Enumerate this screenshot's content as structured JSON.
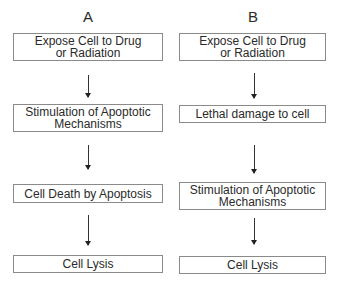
{
  "diagram": {
    "type": "flowchart",
    "columns": [
      {
        "label": "A",
        "steps": [
          "Expose Cell to Drug or Radiation",
          "Stimulation of Apoptotic Mechanisms",
          "Cell Death by Apoptosis",
          "Cell Lysis"
        ]
      },
      {
        "label": "B",
        "steps": [
          "Expose Cell to Drug or Radiation",
          "Lethal damage to cell",
          "Stimulation of Apoptotic Mechanisms",
          "Cell Lysis"
        ]
      }
    ],
    "colors": {
      "text": "#2a2a2a",
      "border": "#8a8a8a",
      "arrow": "#222222",
      "background": "#ffffff"
    }
  }
}
